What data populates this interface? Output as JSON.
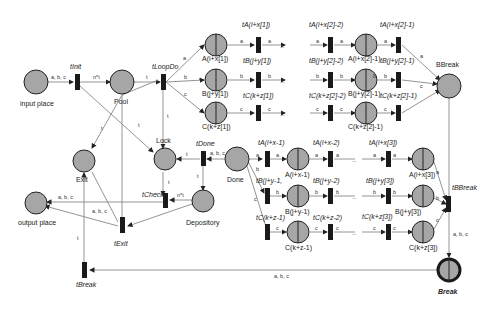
{
  "places": {
    "input": "input place",
    "pool": "Pool",
    "exit": "Exit",
    "lock": "Lock",
    "output": "output place",
    "depository": "Depository",
    "done": "Done",
    "bbreak": "BBreak",
    "break": "Break",
    "a1": "A(i+x[1])",
    "b1": "B(j+y[1])",
    "c1": "C(k+z[1])",
    "a2": "A(i+x[2]-1)",
    "b2": "B(j+y[2]-1)",
    "c2": "C(k+z[2]-1)",
    "ax1": "A(i+x-1)",
    "by1": "B(j+y-1)",
    "cz1": "C(k+z-1)",
    "a3": "A(i+x[3])",
    "b3": "B(j+y[3])",
    "c3": "C(k+z[3])"
  },
  "transitions": {
    "tinit": "tInit",
    "tloopdo": "tLoopDo",
    "tdone": "tDone",
    "tcheck": "tCheck",
    "texit": "tExit",
    "tbreak": "tBreak",
    "tbbreak": "tBBreak",
    "ta1": "tA(i+x[1])",
    "tb1": "tB(j+y[1])",
    "tc1": "tC(k+z[1])",
    "ta2m2": "tA(i+x[2]-2)",
    "tb2m2": "tB(j+y[2]-2)",
    "tc2m2": "tC(k+z[2]-2)",
    "ta2m1": "tA(i+x[2]-1)",
    "tb2m1": "tB(j+y[2]-1)",
    "tc2m1": "tC(k+z[2]-1)",
    "tax1": "tA(i+x-1)",
    "tby1": "tB(j+y-1,",
    "tcz1": "tC(k+z-1)",
    "tax2": "tA(i+x-2)",
    "tby2": "tB(j+y-2)",
    "tcz2": "tC(k+z-2)",
    "ta3": "tA(i+x[3])",
    "tb3": "tB(j+y[3])",
    "tc3": "tC(k+z[3])"
  },
  "arc_labels": {
    "abc": "a, b, c",
    "nt": "n*t",
    "t": "t",
    "a": "a",
    "b": "b",
    "c": "c",
    "ellipsis": "..."
  }
}
